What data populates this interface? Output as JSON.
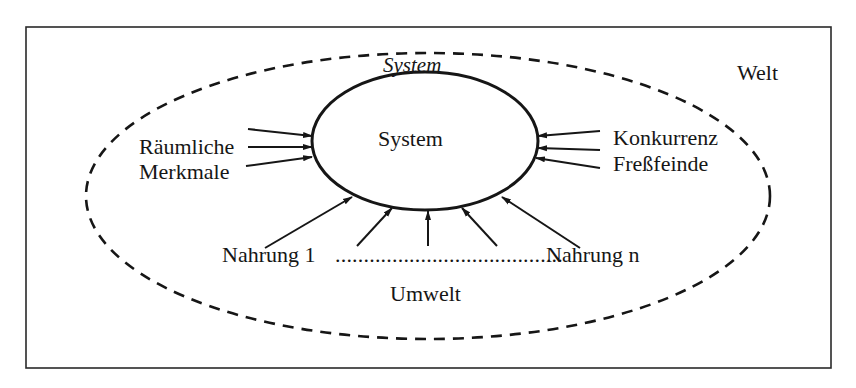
{
  "diagram": {
    "world_label": "Welt",
    "environment_label": "Umwelt",
    "system_boundary_label": "System",
    "system_label": "System",
    "left_inputs": {
      "label_line1": "Räumliche",
      "label_line2": "Merkmale",
      "arrow_count": 3
    },
    "right_inputs": {
      "label_line1": "Konkurrenz",
      "label_line2": "Freßfeinde",
      "arrow_count": 3
    },
    "bottom_inputs": {
      "first_label": "Nahrung 1",
      "dots": "........................................",
      "last_label": "Nahrung n",
      "arrow_count": 5
    }
  },
  "colors": {
    "ink": "#161616",
    "background": "#ffffff",
    "frame": "#2a2a2a"
  }
}
